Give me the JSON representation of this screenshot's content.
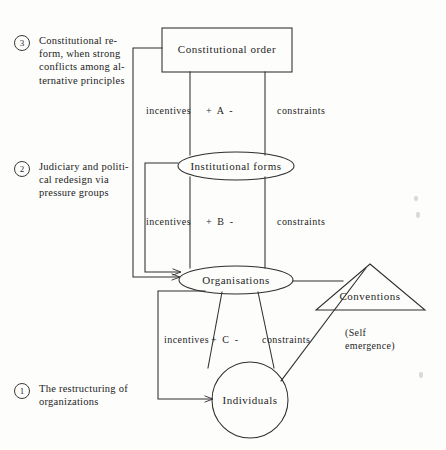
{
  "figure": {
    "background_color": "#fdfdfc",
    "line_color": "#2e2e2e"
  },
  "annotations": [
    {
      "number": "3",
      "text": "Constitutional re-\nform, when strong\nconflicts among al-\nternative principles"
    },
    {
      "number": "2",
      "text": "Judiciary and politi-\ncal redesign via\npressure groups"
    },
    {
      "number": "1",
      "text": "The restructuring of\norganizations"
    }
  ],
  "nodes": {
    "constitutional_order": {
      "label": "Constitutional order",
      "shape": "rectangle"
    },
    "institutional_forms": {
      "label": "Institutional forms",
      "shape": "ellipse"
    },
    "organisations": {
      "label": "Organisations",
      "shape": "ellipse"
    },
    "individuals": {
      "label": "Individuals",
      "shape": "circle"
    },
    "conventions": {
      "label": "Conventions",
      "shape": "triangle"
    }
  },
  "levels": [
    {
      "id": "A",
      "sign_label": "+  A  -",
      "incentives_label": "incentives",
      "constraints_label": "constraints"
    },
    {
      "id": "B",
      "sign_label": "+  B  -",
      "incentives_label": "incentives",
      "constraints_label": "constraints"
    },
    {
      "id": "C",
      "sign_label": "+  C  -",
      "incentives_label": "incentives",
      "constraints_label": "constraints"
    }
  ],
  "self_emergence": {
    "line1": "(Self",
    "line2": "emergence)"
  }
}
